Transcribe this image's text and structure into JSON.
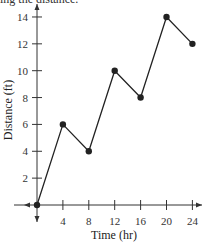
{
  "caption": "ing the distance.",
  "chart_data": {
    "type": "line",
    "title": "",
    "xlabel": "Time (hr)",
    "ylabel": "Distance (ft)",
    "x": [
      0,
      4,
      8,
      12,
      16,
      20,
      24
    ],
    "series": [
      {
        "name": "Distance",
        "values": [
          0,
          6,
          4,
          10,
          8,
          14,
          12
        ]
      }
    ],
    "xticks": [
      4,
      8,
      12,
      16,
      20,
      24
    ],
    "yticks": [
      2,
      4,
      6,
      8,
      10,
      12,
      14
    ],
    "xlim": [
      -6,
      27
    ],
    "ylim": [
      -2,
      15.5
    ],
    "grid": false,
    "legend": null,
    "markers": true,
    "colors": {
      "line": "#222222",
      "axis": "#333333"
    }
  }
}
